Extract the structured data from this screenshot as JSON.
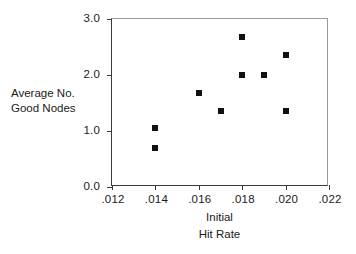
{
  "chart_data": {
    "type": "scatter",
    "title": "",
    "xlabel": "Initial Hit Rate",
    "ylabel": "Average No. Good Nodes",
    "xlim": [
      0.012,
      0.022
    ],
    "ylim": [
      0.0,
      3.0
    ],
    "grid": false,
    "legend": null,
    "marker_color": "#111111",
    "marker_shape": "square",
    "axis_color": "#3a3a3a",
    "x_ticks": [
      0.012,
      0.014,
      0.016,
      0.018,
      0.02,
      0.022
    ],
    "x_tick_labels": [
      ".012",
      ".014",
      ".016",
      ".018",
      ".020",
      ".022"
    ],
    "y_ticks": [
      0.0,
      1.0,
      2.0,
      3.0
    ],
    "y_tick_labels": [
      "0.0",
      "1.0",
      "2.0",
      "3.0"
    ],
    "points": [
      {
        "x": 0.014,
        "y": 1.05
      },
      {
        "x": 0.014,
        "y": 0.7
      },
      {
        "x": 0.016,
        "y": 1.67
      },
      {
        "x": 0.017,
        "y": 1.35
      },
      {
        "x": 0.018,
        "y": 2.67
      },
      {
        "x": 0.018,
        "y": 2.0
      },
      {
        "x": 0.019,
        "y": 2.0
      },
      {
        "x": 0.02,
        "y": 2.35
      },
      {
        "x": 0.02,
        "y": 1.35
      }
    ]
  },
  "labels": {
    "y_axis_line1": "Average No.",
    "y_axis_line2": "Good Nodes",
    "x_axis_line1": "Initial",
    "x_axis_line2": "Hit Rate"
  }
}
